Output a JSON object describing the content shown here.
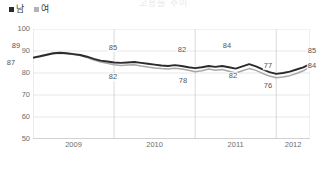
{
  "title": "고용률 추이",
  "legend": {
    "position": "top-left",
    "items": [
      {
        "label": "남",
        "color": "#2b2b2b",
        "marker": "square"
      },
      {
        "label": "여",
        "color": "#a8a8a8",
        "marker": "square"
      }
    ]
  },
  "chart_data": {
    "type": "line",
    "title": "고용률 추이",
    "xlabel": "",
    "ylabel": "",
    "ylim": [
      50,
      100
    ],
    "yticks": [
      50,
      60,
      70,
      80,
      90,
      100
    ],
    "xticks": [
      "2009",
      "2010",
      "2011",
      "2012"
    ],
    "grid": true,
    "x": [
      "2009-01",
      "2009-02",
      "2009-03",
      "2009-04",
      "2009-05",
      "2009-06",
      "2009-07",
      "2009-08",
      "2009-09",
      "2009-10",
      "2009-11",
      "2009-12",
      "2010-01",
      "2010-02",
      "2010-03",
      "2010-04",
      "2010-05",
      "2010-06",
      "2010-07",
      "2010-08",
      "2010-09",
      "2010-10",
      "2010-11",
      "2010-12",
      "2011-01",
      "2011-02",
      "2011-03",
      "2011-04",
      "2011-05",
      "2011-06",
      "2011-07",
      "2011-08",
      "2011-09",
      "2011-10",
      "2011-11",
      "2011-12",
      "2012-01",
      "2012-02",
      "2012-03",
      "2012-04",
      "2012-05",
      "2012-06"
    ],
    "series": [
      {
        "name": "남",
        "color": "#2b2b2b",
        "values": [
          87.0,
          87.6,
          88.3,
          89.0,
          89.2,
          89.0,
          88.6,
          88.2,
          87.4,
          86.4,
          85.6,
          85.2,
          84.8,
          84.6,
          84.8,
          85.0,
          84.6,
          84.2,
          83.8,
          83.4,
          83.2,
          83.6,
          83.2,
          82.6,
          82.2,
          82.6,
          83.2,
          82.8,
          83.2,
          82.6,
          82.0,
          83.0,
          84.0,
          83.0,
          81.6,
          80.4,
          79.6,
          80.0,
          80.6,
          81.6,
          82.6,
          84.0
        ]
      },
      {
        "name": "여",
        "color": "#a8a8a8",
        "values": [
          86.8,
          87.4,
          88.1,
          88.8,
          89.0,
          88.8,
          88.4,
          87.9,
          87.0,
          85.9,
          85.0,
          84.4,
          83.8,
          83.4,
          83.6,
          83.8,
          83.2,
          82.7,
          82.3,
          82.0,
          81.8,
          82.2,
          81.8,
          81.2,
          80.6,
          81.0,
          81.8,
          81.2,
          81.6,
          80.8,
          80.0,
          81.0,
          82.0,
          81.2,
          79.8,
          78.6,
          77.8,
          78.2,
          78.8,
          79.8,
          81.0,
          82.8
        ]
      }
    ],
    "annotations": [
      {
        "text": "89",
        "x": "2009-04",
        "y": 89.0,
        "series": "남",
        "px": 16,
        "py": 46
      },
      {
        "text": "87",
        "x": "2009-01",
        "y": 87.0,
        "series": "여",
        "px": 11,
        "py": 63
      },
      {
        "text": "85",
        "x": "2010-04",
        "y": 85.0,
        "series": "남",
        "px": 113,
        "py": 48
      },
      {
        "text": "82",
        "x": "2010-04",
        "y": 82.0,
        "series": "여",
        "px": 113,
        "py": 77
      },
      {
        "text": "82",
        "x": "2011-01",
        "y": 82.2,
        "series": "남",
        "px": 182,
        "py": 50
      },
      {
        "text": "78",
        "x": "2011-01",
        "y": 80.6,
        "series": "여",
        "px": 183,
        "py": 81
      },
      {
        "text": "84",
        "x": "2011-09",
        "y": 84.0,
        "series": "남",
        "px": 227,
        "py": 46
      },
      {
        "text": "82",
        "x": "2011-09",
        "y": 82.0,
        "series": "여",
        "px": 233,
        "py": 76
      },
      {
        "text": "77",
        "x": "2012-01",
        "y": 79.6,
        "series": "남",
        "px": 268,
        "py": 66
      },
      {
        "text": "76",
        "x": "2012-01",
        "y": 77.8,
        "series": "여",
        "px": 268,
        "py": 86
      },
      {
        "text": "85",
        "x": "2012-06",
        "y": 84.0,
        "series": "남",
        "px": 312,
        "py": 51
      },
      {
        "text": "84",
        "x": "2012-06",
        "y": 82.8,
        "series": "여",
        "px": 312,
        "py": 66
      }
    ]
  }
}
